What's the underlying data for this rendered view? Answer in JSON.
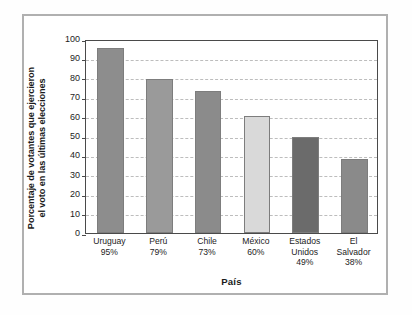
{
  "chart_data": {
    "type": "bar",
    "title": "",
    "xlabel": "País",
    "ylabel_line1": "Porcentaje de votantes que ejercieron",
    "ylabel_line2": "el voto en las últimas elecciones",
    "categories": [
      "Uruguay",
      "Perú",
      "Chile",
      "México",
      "Estados Unidos",
      "El Salvador"
    ],
    "category_lines": [
      [
        "Uruguay"
      ],
      [
        "Perú"
      ],
      [
        "Chile"
      ],
      [
        "México"
      ],
      [
        "Estados",
        "Unidos"
      ],
      [
        "El",
        "Salvador"
      ]
    ],
    "values": [
      95,
      79,
      73,
      60,
      49,
      38
    ],
    "value_labels": [
      "95%",
      "79%",
      "73%",
      "60%",
      "49%",
      "38%"
    ],
    "ylim": [
      0,
      100
    ],
    "ytick_labels": [
      "100",
      "90",
      "80",
      "70",
      "60",
      "50",
      "40",
      "30",
      "20",
      "10",
      "0"
    ],
    "ytick_values": [
      100,
      90,
      80,
      70,
      60,
      50,
      40,
      30,
      20,
      10,
      0
    ],
    "grid": true,
    "legend": false,
    "bar_colors": [
      "#8d8d8d",
      "#9a9a9a",
      "#8b8b8b",
      "#d9d9d9",
      "#6b6b6b",
      "#8a8a8a"
    ],
    "bar_edge_color": "#7d7d7d",
    "axis_color": "#4a4a4a",
    "grid_color": "#bdbdbd",
    "frame_color": "#b0b0b0",
    "text_color": "#1d1d1d"
  }
}
